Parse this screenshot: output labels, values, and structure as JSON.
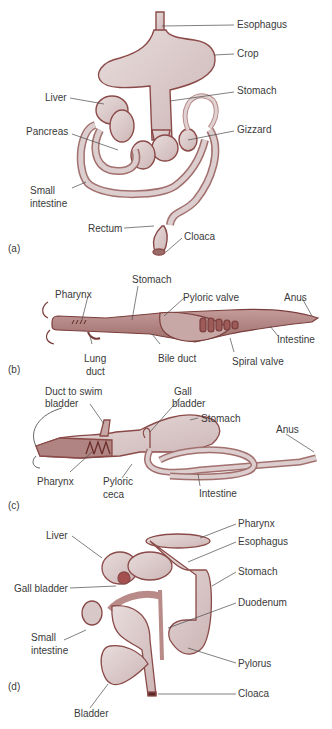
{
  "colors": {
    "organ_fill": "#d9c8c8",
    "organ_fill_light": "#e6dada",
    "organ_outline": "#8a4a48",
    "organ_dark": "#a4706e",
    "leader_line": "#4a4a4a",
    "label_text": "#3a3a3a",
    "background": "#ffffff"
  },
  "panels": [
    {
      "tag": "(a)",
      "subject": "bird digestive tract",
      "labels": [
        "Esophagus",
        "Crop",
        "Stomach",
        "Liver",
        "Gizzard",
        "Pancreas",
        "Small",
        "intestine",
        "Rectum",
        "Cloaca"
      ]
    },
    {
      "tag": "(b)",
      "subject": "lungfish digestive tract",
      "labels": [
        "Stomach",
        "Pharynx",
        "Pyloric valve",
        "Anus",
        "Intestine",
        "Lung",
        "duct",
        "Bile duct",
        "Spiral valve"
      ]
    },
    {
      "tag": "(c)",
      "subject": "bony fish digestive tract",
      "labels": [
        "Duct to swim",
        "bladder",
        "Gall",
        "bladder",
        "Stomach",
        "Anus",
        "Pharynx",
        "Pyloric",
        "ceca",
        "Intestine"
      ]
    },
    {
      "tag": "(d)",
      "subject": "frog digestive tract",
      "labels": [
        "Pharynx",
        "Esophagus",
        "Liver",
        "Stomach",
        "Gall bladder",
        "Duodenum",
        "Small",
        "intestine",
        "Pylorus",
        "Cloaca",
        "Bladder"
      ]
    }
  ]
}
